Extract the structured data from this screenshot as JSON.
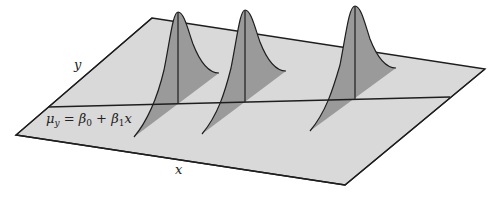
{
  "diagram": {
    "axes": {
      "x_label": "x",
      "y_label": "y"
    },
    "regression_line": {
      "mu": "μ",
      "mu_sub": "y",
      "equals": " = ",
      "beta": "β",
      "beta0_sub": "0",
      "plus": " + ",
      "beta1_sub": "1",
      "x": "x"
    },
    "distributions": [
      {
        "name": "normal-curve-1",
        "center_x_px": 178
      },
      {
        "name": "normal-curve-2",
        "center_x_px": 245
      },
      {
        "name": "normal-curve-3",
        "center_x_px": 355
      }
    ],
    "colors": {
      "plane_fill": "#d9d9d9",
      "curve_fill": "#9a9a9a",
      "shadow_fill": "#a8a8a8",
      "line": "#1e1e1e",
      "background": "#ffffff"
    }
  }
}
